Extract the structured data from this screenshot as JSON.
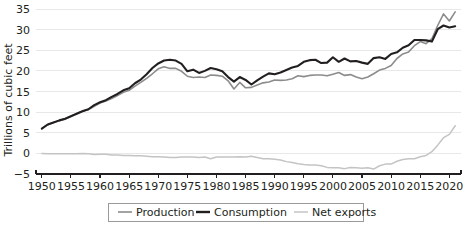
{
  "chart_data": {
    "type": "line",
    "title": "",
    "subtitle": "",
    "xlabel": "",
    "ylabel": "Trillions of cubic feet",
    "xlim": [
      1949,
      2022
    ],
    "ylim": [
      -5,
      35
    ],
    "grid": true,
    "legend_position": "bottom",
    "x_ticks": [
      1950,
      1955,
      1960,
      1965,
      1970,
      1975,
      1980,
      1985,
      1990,
      1995,
      2000,
      2005,
      2010,
      2015,
      2020
    ],
    "y_ticks": [
      -5,
      0,
      5,
      10,
      15,
      20,
      25,
      30,
      35
    ],
    "x": [
      1950,
      1951,
      1952,
      1953,
      1954,
      1955,
      1956,
      1957,
      1958,
      1959,
      1960,
      1961,
      1962,
      1963,
      1964,
      1965,
      1966,
      1967,
      1968,
      1969,
      1970,
      1971,
      1972,
      1973,
      1974,
      1975,
      1976,
      1977,
      1978,
      1979,
      1980,
      1981,
      1982,
      1983,
      1984,
      1985,
      1986,
      1987,
      1988,
      1989,
      1990,
      1991,
      1992,
      1993,
      1994,
      1995,
      1996,
      1997,
      1998,
      1999,
      2000,
      2001,
      2002,
      2003,
      2004,
      2005,
      2006,
      2007,
      2008,
      2009,
      2010,
      2011,
      2012,
      2013,
      2014,
      2015,
      2016,
      2017,
      2018,
      2019,
      2020,
      2021
    ],
    "series": [
      {
        "name": "Production",
        "color": "#8c8c8c",
        "width": 1.6,
        "values": [
          6.0,
          6.9,
          7.5,
          7.9,
          8.3,
          9.0,
          9.7,
          10.3,
          10.6,
          11.4,
          12.2,
          12.7,
          13.3,
          14.0,
          14.8,
          15.3,
          16.3,
          17.2,
          18.2,
          19.3,
          20.5,
          21.0,
          20.6,
          20.6,
          19.9,
          18.7,
          18.4,
          18.5,
          18.4,
          19.0,
          18.9,
          18.7,
          17.6,
          15.6,
          17.2,
          15.9,
          16.0,
          16.6,
          17.1,
          17.3,
          17.8,
          17.7,
          17.8,
          18.1,
          18.8,
          18.6,
          18.9,
          19.0,
          19.0,
          18.8,
          19.2,
          19.6,
          18.9,
          19.1,
          18.5,
          18.1,
          18.5,
          19.3,
          20.2,
          20.6,
          21.3,
          23.0,
          24.1,
          24.6,
          26.1,
          27.1,
          26.6,
          27.8,
          31.0,
          33.8,
          32.1,
          34.3
        ]
      },
      {
        "name": "Consumption",
        "color": "#231f20",
        "width": 2.1,
        "values": [
          6.0,
          7.0,
          7.5,
          8.0,
          8.4,
          9.0,
          9.6,
          10.2,
          10.7,
          11.7,
          12.4,
          12.9,
          13.7,
          14.4,
          15.3,
          15.8,
          17.0,
          17.9,
          19.2,
          20.7,
          21.8,
          22.5,
          22.7,
          22.5,
          21.7,
          19.9,
          20.3,
          19.5,
          20.0,
          20.7,
          20.4,
          19.9,
          18.5,
          17.4,
          18.5,
          17.8,
          16.7,
          17.7,
          18.6,
          19.4,
          19.2,
          19.6,
          20.2,
          20.8,
          21.2,
          22.2,
          22.6,
          22.7,
          21.9,
          22.0,
          23.3,
          22.2,
          23.0,
          22.3,
          22.4,
          22.0,
          21.7,
          23.1,
          23.3,
          22.9,
          24.1,
          24.5,
          25.6,
          26.2,
          27.5,
          27.5,
          27.4,
          27.1,
          30.1,
          31.0,
          30.5,
          30.8
        ]
      },
      {
        "name": "Net exports",
        "color": "#c4c4c4",
        "width": 1.5,
        "values": [
          0.0,
          -0.1,
          -0.1,
          -0.1,
          -0.1,
          -0.1,
          -0.1,
          0.0,
          -0.1,
          -0.3,
          -0.2,
          -0.2,
          -0.4,
          -0.4,
          -0.5,
          -0.5,
          -0.6,
          -0.6,
          -0.7,
          -0.8,
          -0.8,
          -0.9,
          -1.0,
          -1.0,
          -0.9,
          -0.9,
          -0.9,
          -1.0,
          -0.9,
          -1.3,
          -0.9,
          -0.9,
          -0.9,
          -0.9,
          -0.8,
          -0.9,
          -0.7,
          -1.0,
          -1.3,
          -1.3,
          -1.4,
          -1.6,
          -2.0,
          -2.2,
          -2.5,
          -2.7,
          -2.8,
          -2.8,
          -3.0,
          -3.4,
          -3.5,
          -3.5,
          -3.7,
          -3.4,
          -3.5,
          -3.6,
          -3.5,
          -3.8,
          -3.0,
          -2.6,
          -2.6,
          -1.9,
          -1.5,
          -1.3,
          -1.3,
          -0.8,
          -0.5,
          0.4,
          2.0,
          3.8,
          4.6,
          6.7
        ]
      }
    ],
    "legend": [
      {
        "label": "Production",
        "color": "#8c8c8c",
        "width": 1.6
      },
      {
        "label": "Consumption",
        "color": "#231f20",
        "width": 2.4
      },
      {
        "label": "Net exports",
        "color": "#c4c4c4",
        "width": 1.5
      }
    ]
  },
  "axes": {
    "y_title": "Trillions of cubic feet"
  }
}
